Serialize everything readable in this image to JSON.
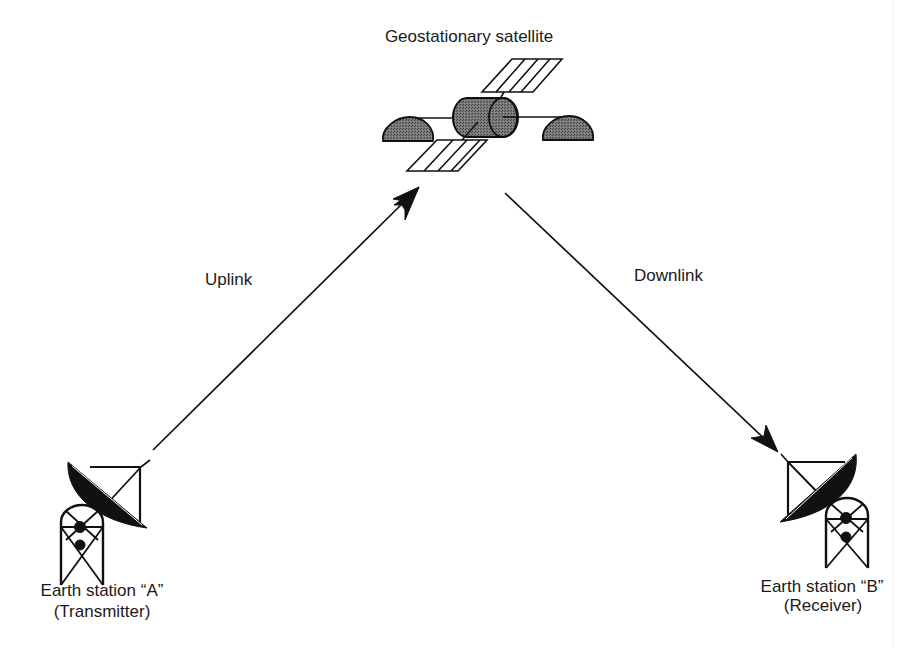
{
  "diagram": {
    "title": "Geostationary satellite",
    "links": {
      "uplink": "Uplink",
      "downlink": "Downlink"
    },
    "stations": [
      {
        "name": "Earth station “A”",
        "role": "(Transmitter)"
      },
      {
        "name": "Earth station “B”",
        "role": "(Receiver)"
      }
    ],
    "icons": {
      "satellite": "satellite-icon",
      "dish_a": "satellite-dish-icon",
      "dish_b": "satellite-dish-icon"
    },
    "colors": {
      "ink": "#111111",
      "satellite_body": "#6e6e6e",
      "background": "#ffffff"
    }
  }
}
